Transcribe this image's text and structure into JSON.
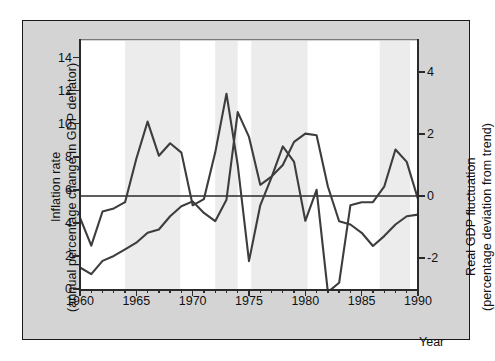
{
  "axes": {
    "x_title": "Year",
    "left_title_line1": "Inflation rate",
    "left_title_line2": "(annual percentage change in GDP deflator)",
    "right_title_line1": "Real GDP fluctuation",
    "right_title_line2": "(percentage deviation from trend)"
  },
  "chart_data": {
    "type": "line",
    "title": "",
    "xlabel": "Year",
    "ylabel": "Inflation rate (annual percentage change in GDP deflator)",
    "y2label": "Real GDP fluctuation (percentage deviation from trend)",
    "xlim": [
      1960,
      1990
    ],
    "ylim": [
      0,
      15
    ],
    "y2lim": [
      -3,
      5
    ],
    "grid": false,
    "legend": "none",
    "x_ticks_major": [
      1960,
      1965,
      1970,
      1975,
      1980,
      1985,
      1990
    ],
    "x_tick_labels": [
      "1960",
      "1965",
      "1970",
      "1975",
      "1980",
      "1985",
      "1990"
    ],
    "x_minor_step": 1,
    "y_ticks_left": [
      0,
      2,
      4,
      6,
      8,
      10,
      12,
      14
    ],
    "y_tick_labels_left": [
      "0",
      "2",
      "4",
      "6",
      "8",
      "10",
      "12",
      "14"
    ],
    "y_ticks_right": [
      -2,
      0,
      2,
      4
    ],
    "y_tick_labels_right": [
      "-2",
      "0",
      "2",
      "4"
    ],
    "zero_line_right_value": 0,
    "zero_line_left_equivalent": 6,
    "x": [
      1960,
      1961,
      1962,
      1963,
      1964,
      1965,
      1966,
      1967,
      1968,
      1969,
      1970,
      1971,
      1972,
      1973,
      1974,
      1975,
      1976,
      1977,
      1978,
      1979,
      1980,
      1981,
      1982,
      1983,
      1984,
      1985,
      1986,
      1987,
      1988,
      1989,
      1990
    ],
    "series": [
      {
        "name": "Inflation rate",
        "axis": "left",
        "units": "percent",
        "values": [
          1.3,
          0.9,
          1.7,
          2.0,
          2.4,
          2.8,
          3.4,
          3.6,
          4.4,
          5.0,
          5.3,
          4.6,
          4.1,
          5.4,
          10.7,
          9.2,
          6.3,
          6.8,
          7.5,
          8.9,
          9.4,
          9.3,
          6.2,
          4.1,
          3.9,
          3.4,
          2.6,
          3.2,
          3.9,
          4.4,
          4.5
        ],
        "color": "#3d3d3d"
      },
      {
        "name": "Real GDP fluctuation",
        "axis": "right",
        "units": "percent deviation from trend",
        "values": [
          -0.7,
          -1.6,
          -0.5,
          -0.4,
          -0.2,
          1.2,
          2.4,
          1.3,
          1.7,
          1.4,
          -0.3,
          -0.1,
          1.4,
          3.3,
          1.0,
          -2.1,
          -0.3,
          0.6,
          1.6,
          1.1,
          -0.8,
          0.2,
          -3.1,
          -2.8,
          -0.3,
          -0.2,
          -0.2,
          0.3,
          1.5,
          1.1,
          -0.1
        ],
        "color": "#3d3d3d"
      }
    ],
    "shaded_bands": {
      "label": "recession/highlight bands",
      "color": "#ececec",
      "ranges": [
        [
          1964.0,
          1968.9
        ],
        [
          1972.0,
          1974.0
        ],
        [
          1975.2,
          1980.2
        ],
        [
          1986.6,
          1989.3
        ]
      ]
    }
  }
}
